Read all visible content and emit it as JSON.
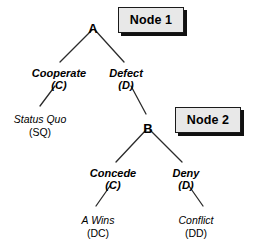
{
  "diagram": {
    "type": "extensive-form-game-tree",
    "title": "",
    "nodes": [
      {
        "id": "A",
        "label": "A",
        "kind": "decision",
        "x": 93,
        "y": 22
      },
      {
        "id": "B",
        "label": "B",
        "kind": "decision",
        "x": 148,
        "y": 122
      }
    ],
    "branches": [
      {
        "id": "a-cooperate",
        "from": "A",
        "name": "Cooperate",
        "code": "(C)",
        "name_x": 59,
        "name_y": 68,
        "code_x": 59,
        "code_y": 80
      },
      {
        "id": "a-defect",
        "from": "A",
        "name": "Defect",
        "code": "(D)",
        "name_x": 126,
        "name_y": 68,
        "code_x": 126,
        "code_y": 80
      },
      {
        "id": "b-concede",
        "from": "B",
        "name": "Concede",
        "code": "(C)",
        "name_x": 113,
        "name_y": 168,
        "code_x": 113,
        "code_y": 180
      },
      {
        "id": "b-deny",
        "from": "B",
        "name": "Deny",
        "code": "(D)",
        "name_x": 186,
        "name_y": 168,
        "code_x": 186,
        "code_y": 180
      }
    ],
    "outcomes": [
      {
        "id": "status-quo",
        "name": "Status Quo",
        "code": "(SQ)",
        "name_x": 40,
        "name_y": 114,
        "code_x": 40,
        "code_y": 127
      },
      {
        "id": "a-wins",
        "name": "A Wins",
        "code": "(DC)",
        "name_x": 98,
        "name_y": 215,
        "code_x": 98,
        "code_y": 228
      },
      {
        "id": "conflict",
        "name": "Conflict",
        "code": "(DD)",
        "name_x": 196,
        "name_y": 215,
        "code_x": 196,
        "code_y": 228
      }
    ],
    "callouts": [
      {
        "id": "node-1",
        "label": "Node 1",
        "x": 118,
        "y": 7,
        "w": 66,
        "h": 26
      },
      {
        "id": "node-2",
        "label": "Node 2",
        "x": 175,
        "y": 107,
        "w": 66,
        "h": 26
      }
    ],
    "edges": [
      {
        "id": "edge-a-left",
        "x1": 92,
        "y1": 30,
        "x2": 60,
        "y2": 62
      },
      {
        "id": "edge-a-left-2",
        "x1": 55,
        "y1": 86,
        "x2": 40,
        "y2": 106
      },
      {
        "id": "edge-a-right",
        "x1": 95,
        "y1": 30,
        "x2": 124,
        "y2": 62
      },
      {
        "id": "edge-a-right-2",
        "x1": 131,
        "y1": 86,
        "x2": 146,
        "y2": 114
      },
      {
        "id": "edge-b-left",
        "x1": 146,
        "y1": 130,
        "x2": 116,
        "y2": 162
      },
      {
        "id": "edge-b-left-2",
        "x1": 110,
        "y1": 186,
        "x2": 96,
        "y2": 206
      },
      {
        "id": "edge-b-right",
        "x1": 150,
        "y1": 130,
        "x2": 182,
        "y2": 162
      },
      {
        "id": "edge-b-right-2",
        "x1": 189,
        "y1": 186,
        "x2": 203,
        "y2": 206
      }
    ],
    "colors": {
      "line": "#2b2b2b",
      "text": "#000000",
      "callout_fill": "#e8e8e8",
      "callout_border": "#1a1a1a",
      "callout_shadow": "#111111",
      "background": "#ffffff"
    }
  }
}
